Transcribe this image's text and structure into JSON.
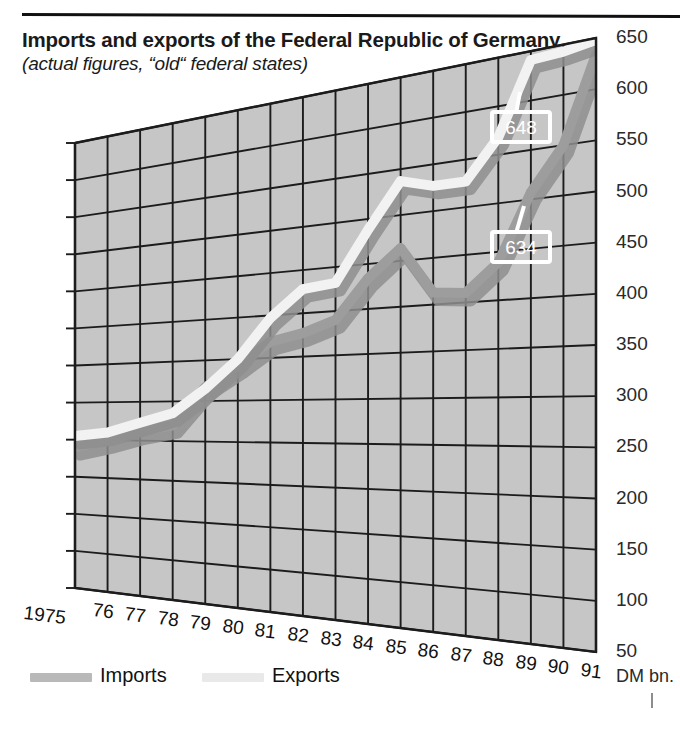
{
  "header": {
    "title": "Imports and exports of the Federal Republic of Germany",
    "subtitle": "(actual figures, “old“ federal states)"
  },
  "axis": {
    "unit_label": "DM bn.",
    "y_ticks": [
      "650",
      "600",
      "550",
      "500",
      "450",
      "400",
      "350",
      "300",
      "250",
      "200",
      "150",
      "100",
      "50"
    ],
    "x_ticks": [
      "1975",
      "76",
      "77",
      "78",
      "79",
      "80",
      "81",
      "82",
      "83",
      "84",
      "85",
      "86",
      "87",
      "88",
      "89",
      "90",
      "91"
    ]
  },
  "legend": {
    "items": [
      {
        "label": "Imports",
        "color": "#b9b9b9"
      },
      {
        "label": "Exports",
        "color": "#e9e9e9"
      }
    ]
  },
  "callouts": [
    {
      "name": "exports-end-value",
      "value": "648"
    },
    {
      "name": "imports-end-value",
      "value": "634"
    }
  ],
  "colors": {
    "panel_fill": "#c6c6c6",
    "grid_line": "#1c1c1c",
    "imports_line": "#9d9d9d",
    "exports_line": "#f2f2f2",
    "rule": "#111111"
  },
  "chart_data": {
    "type": "line",
    "title": "Imports and exports of the Federal Republic of Germany",
    "subtitle": "(actual figures, “old“ federal states)",
    "xlabel": "",
    "ylabel": "DM bn.",
    "ylim": [
      50,
      650
    ],
    "ytick_step": 50,
    "grid": true,
    "legend_position": "bottom-left",
    "projection": "3d-perspective-wall",
    "x": [
      "1975",
      "1976",
      "1977",
      "1978",
      "1979",
      "1980",
      "1981",
      "1982",
      "1983",
      "1984",
      "1985",
      "1986",
      "1987",
      "1988",
      "1989",
      "1990",
      "1991"
    ],
    "series": [
      {
        "name": "Imports",
        "color": "#9d9d9d",
        "values": [
          240,
          250,
          262,
          270,
          317,
          342,
          369,
          377,
          390,
          434,
          464,
          413,
          410,
          439,
          507,
          550,
          634
        ],
        "end_label": "634"
      },
      {
        "name": "Exports",
        "color": "#f2f2f2",
        "values": [
          255,
          260,
          273,
          285,
          315,
          350,
          397,
          428,
          432,
          488,
          537,
          527,
          527,
          568,
          641,
          643,
          648
        ],
        "end_label": "648"
      }
    ]
  }
}
